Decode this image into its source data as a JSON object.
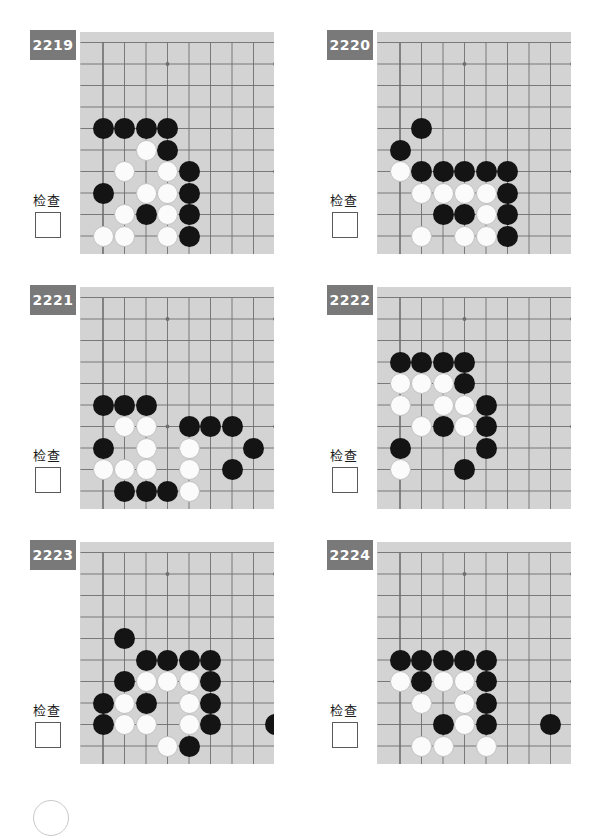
{
  "page": {
    "board_bg_color": "#d3d3d3",
    "grid_line_color": "#6e6e6e",
    "badge_color": "#797979",
    "black_stone_color": "#141414",
    "white_stone_color": "#fbfbfb",
    "columns": 2,
    "rows": 3,
    "board": {
      "cols": 9,
      "rows": 9,
      "cell": 21.5,
      "origin_x": 23,
      "origin_y": 32,
      "star_points": [
        [
          3,
          1
        ],
        [
          8,
          1
        ],
        [
          3,
          6
        ],
        [
          8,
          6
        ]
      ],
      "edges": {
        "left": true,
        "bottom": true
      }
    }
  },
  "common": {
    "check_label": "检查",
    "checkbox_value": ""
  },
  "problems": [
    {
      "number": "2219",
      "check_label": "检查",
      "black": [
        [
          0,
          4
        ],
        [
          1,
          4
        ],
        [
          2,
          4
        ],
        [
          3,
          4
        ],
        [
          3,
          5
        ],
        [
          4,
          6
        ],
        [
          0,
          7
        ],
        [
          4,
          7
        ],
        [
          2,
          8
        ],
        [
          4,
          8
        ],
        [
          4,
          9
        ]
      ],
      "white": [
        [
          2,
          5
        ],
        [
          1,
          6
        ],
        [
          3,
          6
        ],
        [
          2,
          7
        ],
        [
          3,
          7
        ],
        [
          1,
          8
        ],
        [
          3,
          8
        ],
        [
          0,
          9
        ],
        [
          1,
          9
        ],
        [
          3,
          9
        ]
      ]
    },
    {
      "number": "2220",
      "check_label": "检查",
      "black": [
        [
          1,
          4
        ],
        [
          0,
          5
        ],
        [
          1,
          6
        ],
        [
          2,
          6
        ],
        [
          3,
          6
        ],
        [
          4,
          6
        ],
        [
          5,
          6
        ],
        [
          5,
          7
        ],
        [
          2,
          8
        ],
        [
          3,
          8
        ],
        [
          5,
          8
        ],
        [
          5,
          9
        ]
      ],
      "white": [
        [
          0,
          6
        ],
        [
          1,
          7
        ],
        [
          2,
          7
        ],
        [
          3,
          7
        ],
        [
          4,
          7
        ],
        [
          4,
          8
        ],
        [
          1,
          9
        ],
        [
          3,
          9
        ],
        [
          4,
          9
        ]
      ]
    },
    {
      "number": "2221",
      "check_label": "检查",
      "black": [
        [
          0,
          5
        ],
        [
          1,
          5
        ],
        [
          2,
          5
        ],
        [
          4,
          6
        ],
        [
          5,
          6
        ],
        [
          6,
          6
        ],
        [
          0,
          7
        ],
        [
          7,
          7
        ],
        [
          6,
          8
        ],
        [
          1,
          9
        ],
        [
          2,
          9
        ],
        [
          3,
          9
        ]
      ],
      "white": [
        [
          1,
          6
        ],
        [
          2,
          6
        ],
        [
          2,
          7
        ],
        [
          4,
          7
        ],
        [
          0,
          8
        ],
        [
          1,
          8
        ],
        [
          2,
          8
        ],
        [
          4,
          8
        ],
        [
          4,
          9
        ]
      ]
    },
    {
      "number": "2222",
      "check_label": "检查",
      "black": [
        [
          0,
          3
        ],
        [
          1,
          3
        ],
        [
          2,
          3
        ],
        [
          3,
          3
        ],
        [
          3,
          4
        ],
        [
          4,
          5
        ],
        [
          2,
          6
        ],
        [
          4,
          6
        ],
        [
          0,
          7
        ],
        [
          4,
          7
        ],
        [
          3,
          8
        ]
      ],
      "white": [
        [
          0,
          4
        ],
        [
          1,
          4
        ],
        [
          2,
          4
        ],
        [
          0,
          5
        ],
        [
          2,
          5
        ],
        [
          3,
          5
        ],
        [
          1,
          6
        ],
        [
          3,
          6
        ],
        [
          0,
          8
        ]
      ]
    },
    {
      "number": "2223",
      "check_label": "检查",
      "black": [
        [
          1,
          4
        ],
        [
          2,
          5
        ],
        [
          3,
          5
        ],
        [
          4,
          5
        ],
        [
          5,
          5
        ],
        [
          1,
          6
        ],
        [
          5,
          6
        ],
        [
          0,
          7
        ],
        [
          2,
          7
        ],
        [
          5,
          7
        ],
        [
          0,
          8
        ],
        [
          5,
          8
        ],
        [
          8,
          8
        ],
        [
          4,
          9
        ]
      ],
      "white": [
        [
          2,
          6
        ],
        [
          3,
          6
        ],
        [
          4,
          6
        ],
        [
          1,
          7
        ],
        [
          4,
          7
        ],
        [
          1,
          8
        ],
        [
          2,
          8
        ],
        [
          4,
          8
        ],
        [
          3,
          9
        ]
      ]
    },
    {
      "number": "2224",
      "check_label": "检查",
      "black": [
        [
          0,
          5
        ],
        [
          1,
          5
        ],
        [
          2,
          5
        ],
        [
          3,
          5
        ],
        [
          4,
          5
        ],
        [
          1,
          6
        ],
        [
          4,
          6
        ],
        [
          4,
          7
        ],
        [
          2,
          8
        ],
        [
          4,
          8
        ],
        [
          7,
          8
        ]
      ],
      "white": [
        [
          0,
          6
        ],
        [
          2,
          6
        ],
        [
          3,
          6
        ],
        [
          1,
          7
        ],
        [
          3,
          7
        ],
        [
          3,
          8
        ],
        [
          1,
          9
        ],
        [
          2,
          9
        ],
        [
          4,
          9
        ]
      ]
    }
  ]
}
